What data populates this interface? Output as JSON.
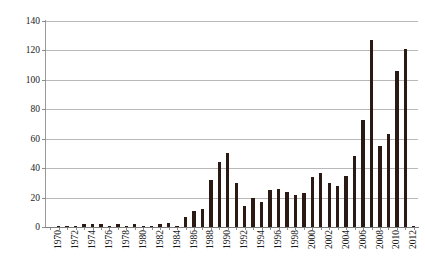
{
  "figure": {
    "caption": "",
    "background_color": "#ffffff",
    "bar_color": "#2b1a14",
    "gridline_color": "#b9b9b9",
    "axis_color": "#8d8d8d"
  },
  "chart_data": {
    "type": "bar",
    "title": "",
    "subtitle": "",
    "xlabel": "",
    "ylabel": "",
    "legend": [],
    "legend_position": "none",
    "grid": true,
    "gridlines_axis": "y",
    "xlim_categories": [
      "1970",
      "2013"
    ],
    "ylim": [
      0,
      140
    ],
    "ytick_step": 20,
    "yticks": [
      0,
      20,
      40,
      60,
      80,
      100,
      120,
      140
    ],
    "ytick_labels": [
      "0",
      "20",
      "40",
      "60",
      "80",
      "100",
      "120",
      "140"
    ],
    "xtick_step_years": 2,
    "xtick_labels": [
      "1970",
      "1972",
      "1974",
      "1976",
      "1978",
      "1980",
      "1982",
      "1984",
      "1986",
      "1988",
      "1990",
      "1992",
      "1994",
      "1996",
      "1998",
      "2000",
      "2002",
      "2004",
      "2006",
      "2008",
      "2010",
      "2012"
    ],
    "categories": [
      "1970",
      "1971",
      "1972",
      "1973",
      "1974",
      "1975",
      "1976",
      "1977",
      "1978",
      "1979",
      "1980",
      "1981",
      "1982",
      "1983",
      "1984",
      "1985",
      "1986",
      "1987",
      "1988",
      "1989",
      "1990",
      "1991",
      "1992",
      "1993",
      "1994",
      "1995",
      "1996",
      "1997",
      "1998",
      "1999",
      "2000",
      "2001",
      "2002",
      "2003",
      "2004",
      "2005",
      "2006",
      "2007",
      "2008",
      "2009",
      "2010",
      "2011",
      "2012",
      "2013"
    ],
    "values": [
      0,
      1,
      1,
      1,
      2,
      2,
      2,
      1,
      2,
      1,
      2,
      1,
      1,
      2,
      3,
      1,
      7,
      11,
      12,
      32,
      44,
      50,
      30,
      14,
      20,
      17,
      25,
      26,
      24,
      22,
      23,
      34,
      37,
      30,
      28,
      35,
      48,
      73,
      127,
      55,
      63,
      106,
      121,
      1
    ]
  }
}
